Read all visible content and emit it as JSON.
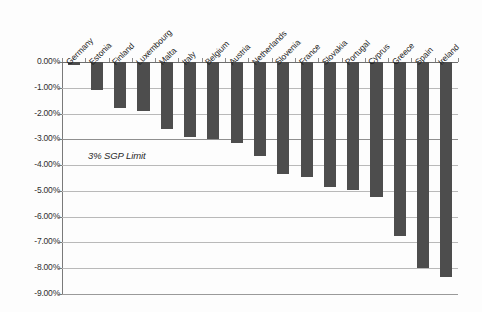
{
  "chart_data": {
    "type": "bar",
    "title": "",
    "subtitle": "",
    "xlabel": "",
    "ylabel": "",
    "ylim": [
      -9.0,
      0.0
    ],
    "ytick_labels": [
      "0.00%",
      "-1.00%",
      "-2.00%",
      "-3.00%",
      "-4.00%",
      "-5.00%",
      "-6.00%",
      "-7.00%",
      "-8.00%",
      "-9.00%"
    ],
    "ytick_values": [
      0.0,
      -1.0,
      -2.0,
      -3.0,
      -4.0,
      -5.0,
      -6.0,
      -7.0,
      -8.0,
      -9.0
    ],
    "grid": true,
    "legend": "none",
    "orientation": "vertical",
    "value_unit": "percent",
    "categories": [
      "Germany",
      "Estonia",
      "Finland",
      "Luxembourg",
      "Malta",
      "Italy",
      "Belgium",
      "Austria",
      "Netherlands",
      "Slovenia",
      "France",
      "Slovakia",
      "Portugal",
      "Cyprus",
      "Greece",
      "Spain",
      "Ireland"
    ],
    "values": [
      -0.1,
      -1.1,
      -1.8,
      -1.9,
      -2.6,
      -2.9,
      -3.0,
      -3.15,
      -3.65,
      -4.35,
      -4.45,
      -4.85,
      -4.95,
      -5.25,
      -6.75,
      -8.0,
      -8.35
    ],
    "annotations": [
      {
        "text": "3% SGP Limit",
        "value": -3.0,
        "style": "italic"
      }
    ],
    "series": [
      {
        "name": "Budget balance (% of GDP)",
        "values": [
          -0.1,
          -1.1,
          -1.8,
          -1.9,
          -2.6,
          -2.9,
          -3.0,
          -3.15,
          -3.65,
          -4.35,
          -4.45,
          -4.85,
          -4.95,
          -5.25,
          -6.75,
          -8.0,
          -8.35
        ]
      }
    ],
    "colors": {
      "bar": "#4d4d4d",
      "gridline": "#b9b9b9",
      "axis": "#7a7a7a",
      "background": "#fdfdfd",
      "text": "#1f1f1f"
    }
  }
}
